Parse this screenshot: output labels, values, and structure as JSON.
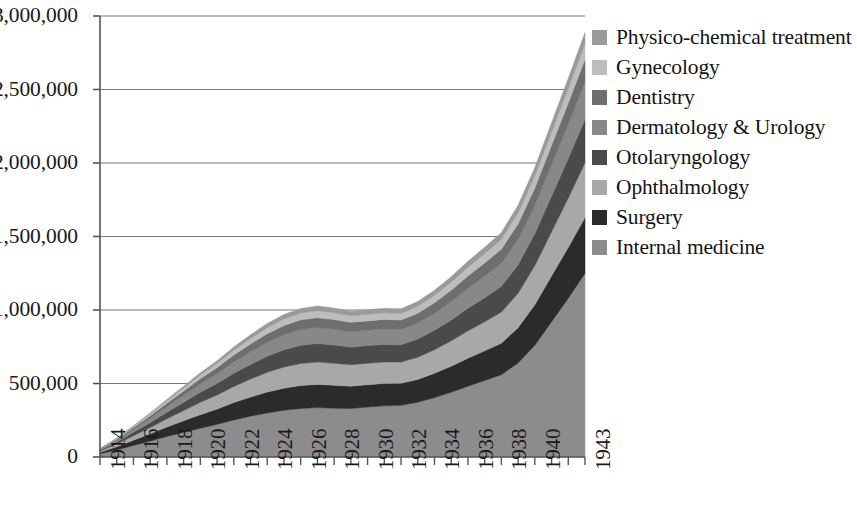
{
  "chart_data": {
    "type": "area",
    "stacked": true,
    "title": "",
    "subtitle": "",
    "xlabel": "",
    "ylabel": "",
    "grid": true,
    "gridlines_axis": "y",
    "legend_position": "right",
    "ylim": [
      0,
      3000000
    ],
    "ytick_labels": [
      "3,000,000",
      "2,500,000",
      "2,000,000",
      "1,500,000",
      "1,000,000",
      "500,000",
      "0"
    ],
    "ytick_values": [
      3000000,
      2500000,
      2000000,
      1500000,
      1000000,
      500000,
      0
    ],
    "x": [
      1914,
      1915,
      1916,
      1917,
      1918,
      1919,
      1920,
      1921,
      1922,
      1923,
      1924,
      1925,
      1926,
      1927,
      1928,
      1929,
      1930,
      1931,
      1932,
      1933,
      1934,
      1935,
      1936,
      1937,
      1938,
      1939,
      1940,
      1941,
      1942,
      1943
    ],
    "xtick_labels": [
      "1914",
      "",
      "1916",
      "",
      "1918",
      "",
      "1920",
      "",
      "1922",
      "",
      "1924",
      "",
      "1926",
      "",
      "1928",
      "",
      "1930",
      "",
      "1932",
      "",
      "1934",
      "",
      "1936",
      "",
      "1938",
      "",
      "1940",
      "",
      "",
      "1943"
    ],
    "xtick_labels_shown": [
      "1914",
      "1916",
      "1918",
      "1920",
      "1922",
      "1924",
      "1926",
      "1928",
      "1930",
      "1932",
      "1934",
      "1936",
      "1938",
      "1940",
      "1943"
    ],
    "series": [
      {
        "name": "Internal medicine",
        "color": "#8c8c8c",
        "stack_order": 1,
        "values": [
          22000,
          48000,
          78000,
          108000,
          140000,
          168000,
          196000,
          222000,
          252000,
          278000,
          300000,
          318000,
          330000,
          336000,
          332000,
          330000,
          340000,
          348000,
          352000,
          372000,
          404000,
          440000,
          482000,
          520000,
          560000,
          640000,
          760000,
          920000,
          1080000,
          1250000
        ]
      },
      {
        "name": "Surgery",
        "color": "#2b2b2b",
        "stack_order": 2,
        "values": [
          10000,
          22000,
          36000,
          50000,
          64000,
          78000,
          92000,
          104000,
          118000,
          130000,
          142000,
          150000,
          156000,
          158000,
          156000,
          152000,
          152000,
          152000,
          150000,
          156000,
          166000,
          178000,
          190000,
          202000,
          214000,
          240000,
          276000,
          312000,
          346000,
          380000
        ]
      },
      {
        "name": "Ophthalmology",
        "color": "#a8a8a8",
        "stack_order": 3,
        "values": [
          8000,
          18000,
          30000,
          42000,
          56000,
          70000,
          84000,
          96000,
          110000,
          122000,
          134000,
          144000,
          150000,
          152000,
          150000,
          146000,
          146000,
          146000,
          144000,
          150000,
          160000,
          172000,
          186000,
          198000,
          212000,
          234000,
          266000,
          300000,
          336000,
          372000
        ]
      },
      {
        "name": "Otolaryngology",
        "color": "#4a4a4a",
        "stack_order": 4,
        "values": [
          6000,
          14000,
          24000,
          34000,
          45000,
          56000,
          68000,
          78000,
          90000,
          100000,
          110000,
          118000,
          124000,
          126000,
          124000,
          120000,
          120000,
          120000,
          118000,
          124000,
          132000,
          142000,
          154000,
          164000,
          176000,
          194000,
          218000,
          244000,
          270000,
          296000
        ]
      },
      {
        "name": "Dermatology & Urology",
        "color": "#888888",
        "stack_order": 5,
        "values": [
          5000,
          12000,
          20000,
          29000,
          38000,
          48000,
          58000,
          67000,
          77000,
          86000,
          95000,
          102000,
          107000,
          109000,
          107000,
          104000,
          104000,
          105000,
          104000,
          109000,
          116000,
          125000,
          136000,
          146000,
          156000,
          172000,
          192000,
          214000,
          234000,
          254000
        ]
      },
      {
        "name": "Dentistry",
        "color": "#6e6e6e",
        "stack_order": 6,
        "values": [
          3000,
          7000,
          12000,
          17000,
          23000,
          29000,
          35000,
          41000,
          47000,
          53000,
          58000,
          63000,
          66000,
          67000,
          66000,
          64000,
          64000,
          65000,
          64000,
          67000,
          72000,
          78000,
          84000,
          90000,
          96000,
          106000,
          118000,
          130000,
          142000,
          154000
        ]
      },
      {
        "name": "Gynecology",
        "color": "#bdbdbd",
        "stack_order": 7,
        "values": [
          2000,
          5000,
          8000,
          12000,
          16000,
          20000,
          24000,
          28000,
          33000,
          37000,
          41000,
          44000,
          46000,
          47000,
          46000,
          45000,
          45000,
          45000,
          45000,
          47000,
          50000,
          54000,
          59000,
          63000,
          67000,
          74000,
          82000,
          90000,
          98000,
          106000
        ]
      },
      {
        "name": "Physico-chemical treatment",
        "color": "#9a9a9a",
        "stack_order": 8,
        "values": [
          1000,
          3000,
          5000,
          7000,
          10000,
          13000,
          16000,
          19000,
          22000,
          25000,
          28000,
          30000,
          32000,
          32000,
          32000,
          31000,
          31000,
          31000,
          31000,
          32000,
          35000,
          38000,
          41000,
          44000,
          47000,
          52000,
          58000,
          64000,
          70000,
          76000
        ]
      }
    ]
  },
  "legend": {
    "items": [
      {
        "label": "Physico-chemical treatment",
        "color": "#9a9a9a"
      },
      {
        "label": "Gynecology",
        "color": "#bdbdbd"
      },
      {
        "label": "Dentistry",
        "color": "#6e6e6e"
      },
      {
        "label": "Dermatology & Urology",
        "color": "#888888"
      },
      {
        "label": "Otolaryngology",
        "color": "#4a4a4a"
      },
      {
        "label": "Ophthalmology",
        "color": "#a8a8a8"
      },
      {
        "label": "Surgery",
        "color": "#2b2b2b"
      },
      {
        "label": "Internal medicine",
        "color": "#8c8c8c"
      }
    ]
  },
  "axis_style": {
    "axis_color": "#555555",
    "grid_color": "#777777"
  }
}
